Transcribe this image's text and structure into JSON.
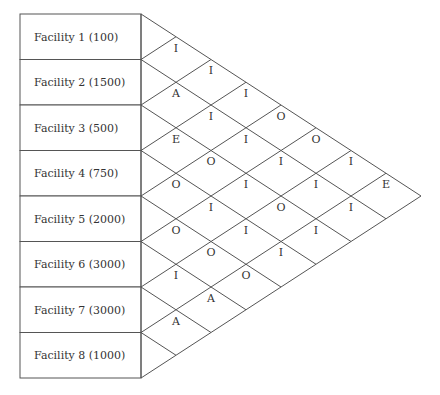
{
  "diagram": {
    "type": "activity-relationship-chart",
    "colors": {
      "line": "#555555",
      "text": "#333333",
      "background": "#ffffff"
    },
    "facilities": [
      {
        "label": "Facility 1 (100)"
      },
      {
        "label": "Facility 2 (1500)"
      },
      {
        "label": "Facility 3 (500)"
      },
      {
        "label": "Facility 4 (750)"
      },
      {
        "label": "Facility 5 (2000)"
      },
      {
        "label": "Facility 6 (3000)"
      },
      {
        "label": "Facility 7 (3000)"
      },
      {
        "label": "Facility 8 (1000)"
      }
    ],
    "relationships": [
      {
        "from": 1,
        "to": 2,
        "code": "I"
      },
      {
        "from": 2,
        "to": 3,
        "code": "A"
      },
      {
        "from": 3,
        "to": 4,
        "code": "E"
      },
      {
        "from": 4,
        "to": 5,
        "code": "O"
      },
      {
        "from": 5,
        "to": 6,
        "code": "O"
      },
      {
        "from": 6,
        "to": 7,
        "code": "I"
      },
      {
        "from": 7,
        "to": 8,
        "code": "A"
      },
      {
        "from": 1,
        "to": 3,
        "code": "I"
      },
      {
        "from": 2,
        "to": 4,
        "code": "I"
      },
      {
        "from": 3,
        "to": 5,
        "code": "O"
      },
      {
        "from": 4,
        "to": 6,
        "code": "I"
      },
      {
        "from": 5,
        "to": 7,
        "code": "O"
      },
      {
        "from": 6,
        "to": 8,
        "code": "A"
      },
      {
        "from": 1,
        "to": 4,
        "code": "I"
      },
      {
        "from": 2,
        "to": 5,
        "code": "I"
      },
      {
        "from": 3,
        "to": 6,
        "code": "I"
      },
      {
        "from": 4,
        "to": 7,
        "code": "I"
      },
      {
        "from": 5,
        "to": 8,
        "code": "O"
      },
      {
        "from": 1,
        "to": 5,
        "code": "O"
      },
      {
        "from": 2,
        "to": 6,
        "code": "I"
      },
      {
        "from": 3,
        "to": 7,
        "code": "O"
      },
      {
        "from": 4,
        "to": 8,
        "code": "I"
      },
      {
        "from": 1,
        "to": 6,
        "code": "O"
      },
      {
        "from": 2,
        "to": 7,
        "code": "I"
      },
      {
        "from": 3,
        "to": 8,
        "code": "I"
      },
      {
        "from": 1,
        "to": 7,
        "code": "I"
      },
      {
        "from": 2,
        "to": 8,
        "code": "I"
      },
      {
        "from": 1,
        "to": 8,
        "code": "E"
      }
    ]
  }
}
